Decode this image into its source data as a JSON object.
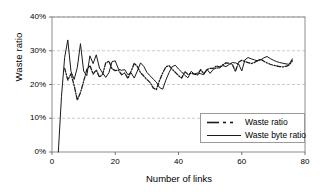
{
  "chart_data": {
    "type": "line",
    "title": "",
    "xlabel": "Number of links",
    "ylabel": "Waste ratio",
    "xlim": [
      0,
      80
    ],
    "ylim": [
      0,
      40
    ],
    "xticks": [
      "0",
      "20",
      "40",
      "60",
      "80"
    ],
    "xtick_values": [
      0,
      20,
      40,
      60,
      80
    ],
    "yticks": [
      "0%",
      "10%",
      "20%",
      "30%",
      "40%"
    ],
    "ytick_values": [
      0,
      10,
      20,
      30,
      40
    ],
    "grid": "horizontal-dashed",
    "legend_position": "inside-lower-right",
    "series": [
      {
        "name": "Waste ratio",
        "style": "dash-dot",
        "color": "#1a1a1a",
        "x": [
          4,
          5,
          6,
          7,
          8,
          9,
          10,
          11,
          12,
          13,
          14,
          15,
          16,
          17,
          18,
          19,
          20,
          21,
          22,
          23,
          24,
          25,
          26,
          27,
          28,
          29,
          30,
          31,
          32,
          33,
          34,
          35,
          36,
          37,
          38,
          39,
          40,
          41,
          42,
          43,
          44,
          45,
          46,
          47,
          48,
          49,
          50,
          51,
          52,
          53,
          54,
          55,
          56,
          57,
          58,
          59,
          60,
          61,
          62,
          63,
          64,
          65,
          66,
          67,
          68,
          69,
          70,
          71,
          72,
          73,
          74,
          75,
          76
        ],
        "values": [
          24.8,
          21.3,
          23.2,
          19.7,
          15.4,
          17.6,
          20.9,
          24.4,
          25.6,
          23.1,
          24.3,
          22.2,
          23.0,
          26.4,
          26.9,
          24.6,
          24.1,
          24.3,
          22.9,
          23.4,
          21.8,
          23.9,
          26.3,
          25.3,
          23.5,
          22.5,
          21.5,
          20.6,
          19.0,
          18.5,
          21.2,
          23.4,
          25.2,
          25.6,
          24.5,
          23.6,
          22.6,
          21.9,
          23.8,
          23.0,
          23.3,
          23.1,
          22.8,
          24.4,
          23.2,
          24.4,
          24.8,
          24.8,
          25.5,
          25.2,
          25.8,
          26.4,
          26.3,
          26.0,
          23.9,
          26.6,
          27.2,
          26.8,
          26.5,
          26.2,
          26.5,
          27.1,
          27.5,
          26.9,
          26.4,
          26.0,
          25.7,
          25.5,
          25.3,
          25.2,
          25.4,
          25.8,
          27.0
        ]
      },
      {
        "name": "Waste byte ratio",
        "style": "solid",
        "color": "#1a1a1a",
        "x": [
          2,
          3,
          4,
          5,
          6,
          7,
          8,
          9,
          10,
          11,
          12,
          13,
          14,
          15,
          16,
          17,
          18,
          19,
          20,
          21,
          22,
          23,
          24,
          25,
          26,
          27,
          28,
          29,
          30,
          31,
          32,
          33,
          34,
          35,
          36,
          37,
          38,
          39,
          40,
          41,
          42,
          43,
          44,
          45,
          46,
          47,
          48,
          49,
          50,
          51,
          52,
          53,
          54,
          55,
          56,
          57,
          58,
          59,
          60,
          61,
          62,
          63,
          64,
          65,
          66,
          67,
          68,
          69,
          70,
          71,
          72,
          73,
          74,
          75,
          76
        ],
        "values": [
          0.0,
          16.5,
          28.0,
          33.2,
          23.9,
          21.5,
          25.0,
          32.1,
          24.0,
          22.6,
          28.5,
          26.2,
          28.8,
          24.9,
          23.4,
          22.1,
          23.5,
          26.8,
          27.0,
          24.6,
          24.2,
          24.4,
          22.9,
          23.5,
          21.9,
          24.0,
          26.4,
          25.4,
          23.6,
          22.6,
          21.6,
          20.7,
          19.1,
          18.6,
          21.3,
          23.5,
          25.3,
          25.7,
          24.6,
          23.7,
          22.7,
          22.0,
          23.9,
          23.1,
          23.4,
          23.2,
          22.9,
          24.5,
          23.3,
          24.5,
          24.9,
          24.9,
          25.6,
          25.3,
          25.9,
          26.5,
          26.4,
          26.1,
          24.0,
          27.3,
          28.0,
          27.6,
          27.3,
          27.0,
          27.3,
          27.9,
          28.3,
          27.7,
          27.2,
          26.8,
          26.5,
          26.3,
          26.1,
          26.0,
          27.6
        ]
      }
    ]
  },
  "legend": {
    "items": [
      {
        "label": "Waste ratio"
      },
      {
        "label": "Waste byte ratio"
      }
    ]
  }
}
